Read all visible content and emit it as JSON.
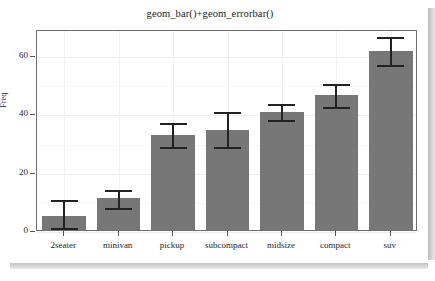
{
  "chart_data": {
    "type": "bar",
    "title": "geom_bar()+geom_errorbar()",
    "xlabel": "",
    "ylabel": "Freq",
    "categories": [
      "2seater",
      "minivan",
      "pickup",
      "subcompact",
      "midsize",
      "compact",
      "suv"
    ],
    "values": [
      4.8,
      11,
      32.5,
      34.5,
      40.5,
      46.5,
      61.5
    ],
    "error_lower": [
      1,
      8,
      29,
      29,
      38,
      42.5,
      57
    ],
    "error_upper": [
      10.5,
      14,
      37,
      41,
      43.5,
      50.5,
      66.5
    ],
    "ylim": [
      0,
      69
    ],
    "ytick_values": [
      0,
      20,
      40,
      60
    ],
    "ytick_labels": [
      "0",
      "20",
      "40",
      "60"
    ],
    "grid": true,
    "legend": "none",
    "bar_color": "#777777",
    "errorbar_color": "#222222",
    "panel_border_color": "#6e6e6e",
    "background_color": "#ffffff"
  }
}
